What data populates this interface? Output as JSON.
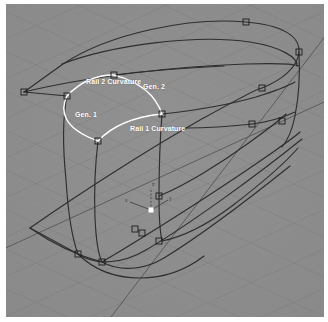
{
  "viewport": {
    "name": "perspective-viewport",
    "background_color": "#8d8d8d",
    "border_color": "#ffffff",
    "grid": {
      "minor_line_color": "#7e7e7e",
      "major_line_color": "#6f6f6f",
      "axis_line_color": "#3f3f3f"
    },
    "geometry_color": "#2e2e2e",
    "highlight_color": "#ffffff",
    "control_point_color": "#1f1f1f"
  },
  "labels": {
    "rail2_curvature": "Rail 2 Curvature",
    "gen2": "Gen. 2",
    "gen1": "Gen. 1",
    "rail1_curvature": "Rail 1 Curvature"
  },
  "axis_gizmo": {
    "name": "world-origin-gizmo",
    "x_label": "x",
    "y_label": "y",
    "z_label": "z",
    "origin_color": "#ffffff"
  },
  "curves": {
    "top_outline": "M 24,92 L 63,64 C 110,33 190,17 246,22 C 282,25 300,36 299,52 C 298,67 282,80 262,88",
    "top_inner_seam": "M 62,64 C 112,45 196,34 250,42 C 282,47 298,58 297,66",
    "top_ridge": "M 24,92 C 90,76 180,66 246,64 C 276,63 294,64 299,66",
    "rail2_highlight": "M 67,96 C 80,82 96,75 114,75 C 134,75 152,88 162,114",
    "rail1_highlight": "M 98,141 C 110,127 126,118 144,116 C 156,115 160,115 163,115",
    "gen1_arc": "M 67,96 C 60,110 62,128 98,141",
    "gen2_arc": "M 114,75 C 140,82 156,96 162,114",
    "left_vertical_a": "M 67,96 C 62,120 63,150 66,180 C 68,212 72,238 78,254",
    "left_vertical_b": "M 98,141 C 95,166 94,192 95,218 C 96,240 98,254 102,262",
    "mid_vertical": "M 162,114 C 160,140 159,168 159,196 C 159,216 160,232 162,241",
    "right_vertical": "M 299,52 C 300,72 299,96 295,116 C 292,131 287,141 282,147",
    "bottom_front": "M 78,254 C 92,268 112,278 140,278 C 168,278 196,266 216,248",
    "bottom_curve_a": "M 102,262 C 120,272 144,270 164,258 C 200,236 250,198 290,166",
    "bottom_curve_b": "M 78,254 C 96,266 122,264 146,250 C 190,224 256,176 302,139",
    "bottom_seam": "M 162,241 C 182,237 208,224 232,206 C 262,183 286,162 298,148",
    "bottom_flat_left": "M 30,228 L 78,254",
    "bottom_flat_edge": "M 30,228 C 70,200 140,154 200,120 C 240,98 262,88 262,88",
    "bottom_flat_back": "M 30,228 L 78,254 C 96,266 122,264 146,250",
    "body_side_upper": "M 162,114 C 186,110 222,104 252,96 C 270,91 282,88 295,84",
    "body_side_mid": "M 162,130 C 190,127 226,122 256,115"
  },
  "control_points": [
    {
      "x": 67,
      "y": 96
    },
    {
      "x": 114,
      "y": 75
    },
    {
      "x": 98,
      "y": 141
    },
    {
      "x": 162,
      "y": 114
    },
    {
      "x": 246,
      "y": 22
    },
    {
      "x": 299,
      "y": 52
    },
    {
      "x": 262,
      "y": 88
    },
    {
      "x": 282,
      "y": 117
    },
    {
      "x": 159,
      "y": 196
    },
    {
      "x": 134,
      "y": 229
    },
    {
      "x": 102,
      "y": 262
    },
    {
      "x": 78,
      "y": 254
    },
    {
      "x": 162,
      "y": 241
    },
    {
      "x": 252,
      "y": 124
    }
  ]
}
